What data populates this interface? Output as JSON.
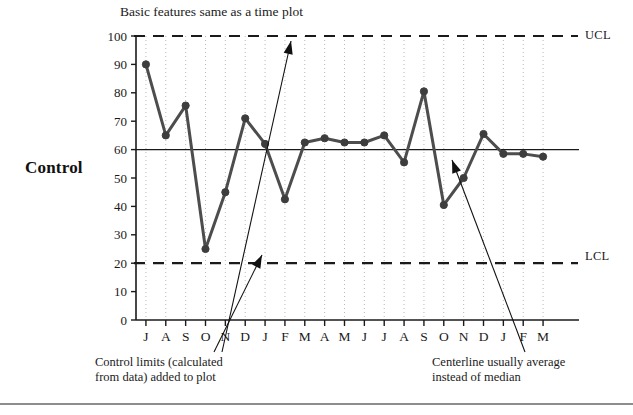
{
  "figure": {
    "side_label": "Control",
    "subtitle": "Basic features same as a time plot",
    "ucl_label": "UCL",
    "lcl_label": "LCL"
  },
  "annotations": {
    "left_line1": "Control limits (calculated",
    "left_line2": "from data) added to plot",
    "right_line1": "Centerline usually average",
    "right_line2": "instead of median"
  },
  "colors": {
    "series": "#4d4d4d",
    "marker": "#3d3d3d",
    "axis": "#1a1a1a",
    "grid": "#b9b9b9",
    "limit": "#1a1a1a",
    "center": "#1a1a1a",
    "arrow": "#111111",
    "rule": "#8d8d8d"
  },
  "chart_data": {
    "type": "line",
    "title": "",
    "subtitle": "Basic features same as a time plot",
    "xlabel": "",
    "ylabel": "",
    "ylim": [
      0,
      100
    ],
    "ytick_step": 10,
    "yticks": [
      0,
      10,
      20,
      30,
      40,
      50,
      60,
      70,
      80,
      90,
      100
    ],
    "ytick_labels": [
      "0",
      "10",
      "20",
      "30",
      "40",
      "50",
      "60",
      "70",
      "80",
      "90",
      "100"
    ],
    "grid": "vertical-dotted",
    "legend": "none",
    "categories": [
      "J",
      "A",
      "S",
      "O",
      "N",
      "D",
      "J",
      "F",
      "M",
      "A",
      "M",
      "J",
      "J",
      "A",
      "S",
      "O",
      "N",
      "D",
      "J",
      "F",
      "M"
    ],
    "values": [
      90,
      65,
      75.5,
      25,
      45,
      71,
      62,
      42.5,
      62.5,
      64,
      62.5,
      62.5,
      65,
      55.5,
      80.5,
      40.5,
      50,
      65.5,
      58.5,
      58.5,
      57.5
    ],
    "reference_lines": [
      {
        "name": "UCL",
        "value": 100,
        "style": "dashed",
        "label": "UCL"
      },
      {
        "name": "centerline",
        "value": 60,
        "style": "solid",
        "label": ""
      },
      {
        "name": "LCL",
        "value": 20,
        "style": "dashed",
        "label": "LCL"
      }
    ],
    "callouts": [
      {
        "text": "Control limits (calculated from data) added to plot",
        "points_to": "LCL line"
      },
      {
        "text": "Centerline usually average instead of median",
        "points_to": "centerline"
      }
    ]
  }
}
